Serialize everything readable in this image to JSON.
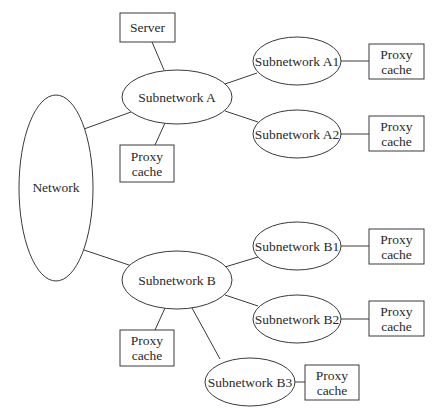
{
  "diagram": {
    "type": "network-topology",
    "nodes": {
      "server": {
        "label": "Server"
      },
      "network": {
        "label": "Network"
      },
      "subnet_a": {
        "label": "Subnetwork A"
      },
      "proxy_a": {
        "line1": "Proxy",
        "line2": "cache"
      },
      "subnet_a1": {
        "label": "Subnetwork A1"
      },
      "proxy_a1": {
        "line1": "Proxy",
        "line2": "cache"
      },
      "subnet_a2": {
        "label": "Subnetwork A2"
      },
      "proxy_a2": {
        "line1": "Proxy",
        "line2": "cache"
      },
      "subnet_b": {
        "label": "Subnetwork B"
      },
      "proxy_b": {
        "line1": "Proxy",
        "line2": "cache"
      },
      "subnet_b1": {
        "label": "Subnetwork B1"
      },
      "proxy_b1": {
        "line1": "Proxy",
        "line2": "cache"
      },
      "subnet_b2": {
        "label": "Subnetwork B2"
      },
      "proxy_b2": {
        "line1": "Proxy",
        "line2": "cache"
      },
      "subnet_b3": {
        "label": "Subnetwork B3"
      },
      "proxy_b3": {
        "line1": "Proxy",
        "line2": "cache"
      }
    },
    "edges": [
      [
        "server",
        "subnet_a"
      ],
      [
        "network",
        "subnet_a"
      ],
      [
        "subnet_a",
        "proxy_a"
      ],
      [
        "subnet_a",
        "subnet_a1"
      ],
      [
        "subnet_a",
        "subnet_a2"
      ],
      [
        "subnet_a1",
        "proxy_a1"
      ],
      [
        "subnet_a2",
        "proxy_a2"
      ],
      [
        "network",
        "subnet_b"
      ],
      [
        "subnet_b",
        "proxy_b"
      ],
      [
        "subnet_b",
        "subnet_b1"
      ],
      [
        "subnet_b",
        "subnet_b2"
      ],
      [
        "subnet_b",
        "subnet_b3"
      ],
      [
        "subnet_b1",
        "proxy_b1"
      ],
      [
        "subnet_b2",
        "proxy_b2"
      ],
      [
        "subnet_b3",
        "proxy_b3"
      ]
    ]
  }
}
